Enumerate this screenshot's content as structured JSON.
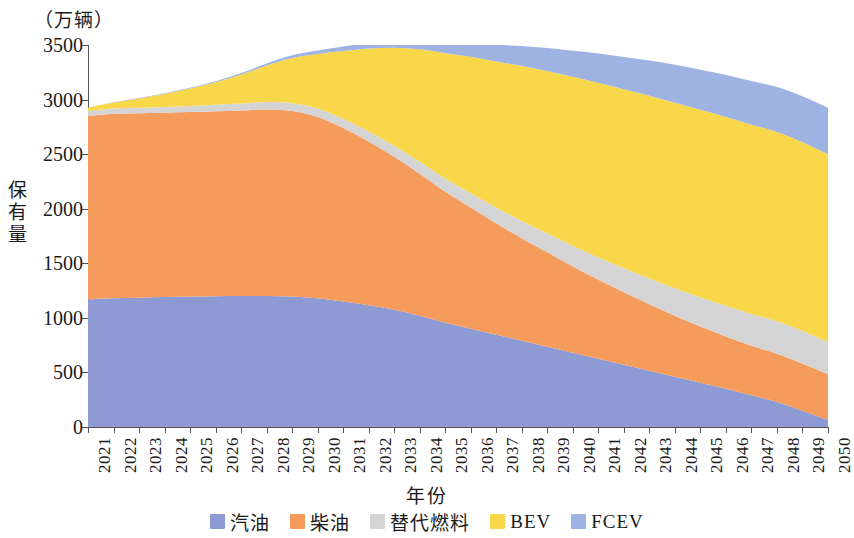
{
  "unit_caption": "（万辆）",
  "axes": {
    "y_title": "保有量",
    "x_title": "年份",
    "y_ticks": [
      "0",
      "500",
      "1000",
      "1500",
      "2000",
      "2500",
      "3000",
      "3500"
    ],
    "y_min": 0,
    "y_max": 3500
  },
  "legend": {
    "items": [
      {
        "label": "汽油",
        "color": "#8e9ad4"
      },
      {
        "label": "柴油",
        "color": "#f59b5c"
      },
      {
        "label": "替代燃料",
        "color": "#d4d4d4"
      },
      {
        "label": "BEV",
        "color": "#f8d84a"
      },
      {
        "label": "FCEV",
        "color": "#9fb3e3"
      }
    ]
  },
  "chart_data": {
    "type": "area",
    "stacked": true,
    "title": "",
    "subtitle": "",
    "xlabel": "年份",
    "ylabel": "保有量",
    "unit": "万辆",
    "ylim": [
      0,
      3500
    ],
    "grid": false,
    "legend_position": "bottom",
    "categories": [
      "2021",
      "2022",
      "2023",
      "2024",
      "2025",
      "2026",
      "2027",
      "2028",
      "2029",
      "2030",
      "2031",
      "2032",
      "2033",
      "2034",
      "2035",
      "2036",
      "2037",
      "2038",
      "2039",
      "2040",
      "2041",
      "2042",
      "2043",
      "2044",
      "2045",
      "2046",
      "2047",
      "2048",
      "2049",
      "2050"
    ],
    "series": [
      {
        "name": "汽油",
        "color": "#8e9ad4",
        "values": [
          1170,
          1180,
          1185,
          1190,
          1195,
          1198,
          1200,
          1200,
          1195,
          1180,
          1150,
          1115,
          1075,
          1020,
          955,
          900,
          845,
          790,
          735,
          680,
          625,
          570,
          515,
          460,
          405,
          350,
          290,
          230,
          150,
          65
        ]
      },
      {
        "name": "柴油",
        "color": "#f59b5c",
        "values": [
          1680,
          1690,
          1690,
          1690,
          1690,
          1695,
          1700,
          1710,
          1700,
          1660,
          1590,
          1500,
          1400,
          1300,
          1200,
          1110,
          1020,
          940,
          865,
          790,
          725,
          665,
          610,
          560,
          515,
          480,
          455,
          440,
          430,
          420
        ]
      },
      {
        "name": "替代燃料",
        "color": "#d4d4d4",
        "values": [
          45,
          48,
          50,
          53,
          56,
          60,
          64,
          68,
          72,
          78,
          84,
          92,
          100,
          110,
          120,
          132,
          144,
          158,
          172,
          188,
          204,
          220,
          236,
          252,
          266,
          280,
          290,
          298,
          300,
          295
        ]
      },
      {
        "name": "BEV",
        "color": "#f8d84a",
        "values": [
          30,
          55,
          85,
          120,
          160,
          205,
          265,
          335,
          415,
          500,
          620,
          760,
          900,
          1030,
          1150,
          1250,
          1340,
          1420,
          1490,
          1550,
          1600,
          1640,
          1675,
          1700,
          1720,
          1730,
          1735,
          1735,
          1730,
          1720
        ]
      },
      {
        "name": "FCEV",
        "color": "#9fb3e3",
        "values": [
          2,
          3,
          4,
          6,
          8,
          11,
          14,
          18,
          24,
          32,
          42,
          55,
          70,
          88,
          108,
          130,
          155,
          182,
          210,
          240,
          268,
          296,
          322,
          346,
          368,
          386,
          400,
          412,
          420,
          425
        ]
      }
    ]
  }
}
